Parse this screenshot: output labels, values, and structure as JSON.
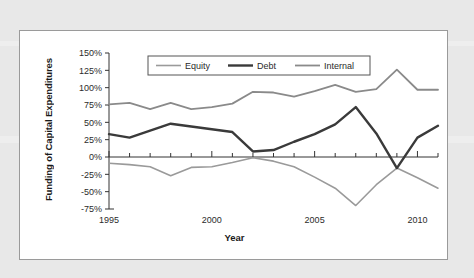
{
  "chart_data": {
    "type": "line",
    "title": "",
    "xlabel": "Year",
    "ylabel": "Funding of Capital Expenditures",
    "x": [
      1995,
      1996,
      1997,
      1998,
      1999,
      2000,
      2001,
      2002,
      2003,
      2004,
      2005,
      2006,
      2007,
      2008,
      2009,
      2010,
      2011
    ],
    "xlim": [
      1995,
      2011
    ],
    "ylim": [
      -75,
      150
    ],
    "ytick_values": [
      150,
      125,
      100,
      75,
      50,
      25,
      0,
      -25,
      -50,
      -75
    ],
    "ytick_labels": [
      "150%",
      "125%",
      "100%",
      "75%",
      "50%",
      "25%",
      "0%",
      "-25%",
      "-50%",
      "-75%"
    ],
    "xtick_values": [
      1995,
      2000,
      2005,
      2010
    ],
    "xtick_labels": [
      "1995",
      "2000",
      "2005",
      "2010"
    ],
    "grid": false,
    "legend_position": "top-center",
    "series": [
      {
        "name": "Equity",
        "color": "#9a9a9a",
        "width": 1.6,
        "values": [
          -9,
          -11,
          -14,
          -27,
          -15,
          -14,
          -8,
          -1,
          -6,
          -14,
          -29,
          -45,
          -70,
          -40,
          -16,
          -30,
          -45
        ]
      },
      {
        "name": "Debt",
        "color": "#3a3a3a",
        "width": 2.4,
        "values": [
          33,
          28,
          38,
          48,
          44,
          40,
          36,
          8,
          10,
          22,
          33,
          47,
          72,
          34,
          -16,
          28,
          45
        ]
      },
      {
        "name": "Internal",
        "color": "#8a8a8a",
        "width": 1.8,
        "values": [
          76,
          78,
          69,
          78,
          69,
          72,
          77,
          94,
          93,
          87,
          95,
          104,
          94,
          98,
          126,
          97,
          97
        ]
      }
    ]
  }
}
